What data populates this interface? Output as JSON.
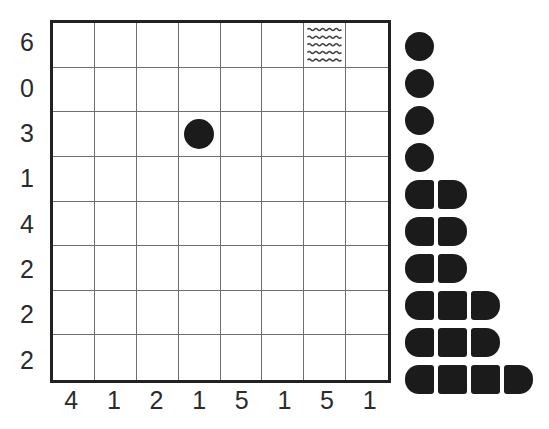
{
  "figure": {
    "kind": "nonogram-style-grid",
    "background_color": "#ffffff",
    "ink_color": "#1b1b1b",
    "grid_line_color": "#6e6e6e",
    "border_color": "#222222"
  },
  "chart_data": {
    "type": "heatmap",
    "title": "",
    "xlabel": "",
    "ylabel": "",
    "grid": true,
    "legend_position": "right",
    "rows": 8,
    "columns": 8,
    "row_labels": [
      "6",
      "0",
      "3",
      "1",
      "4",
      "2",
      "2",
      "2"
    ],
    "column_labels": [
      "4",
      "1",
      "2",
      "1",
      "5",
      "1",
      "5",
      "1"
    ],
    "markers": [
      {
        "name": "filled-circle",
        "row": 3,
        "column": 4,
        "glyph": "circle"
      },
      {
        "name": "wave-hatch",
        "row": 1,
        "column": 7,
        "glyph": "waves",
        "wave_lines": 5
      }
    ],
    "legend_rows": [
      {
        "index": 1,
        "segments": 1
      },
      {
        "index": 2,
        "segments": 1
      },
      {
        "index": 3,
        "segments": 1
      },
      {
        "index": 4,
        "segments": 1
      },
      {
        "index": 5,
        "segments": 2
      },
      {
        "index": 6,
        "segments": 2
      },
      {
        "index": 7,
        "segments": 2
      },
      {
        "index": 8,
        "segments": 3
      },
      {
        "index": 9,
        "segments": 3
      },
      {
        "index": 10,
        "segments": 4
      }
    ],
    "legend_values": [
      1,
      1,
      1,
      1,
      2,
      2,
      2,
      3,
      3,
      4
    ],
    "legend_row_pitch_px": 37,
    "legend_first_row_top_px": 12
  }
}
